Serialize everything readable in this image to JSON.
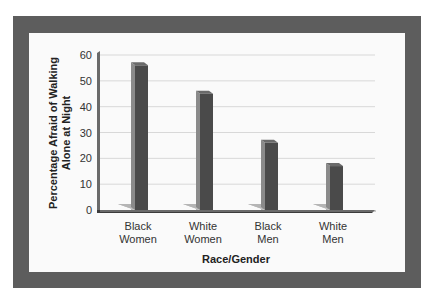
{
  "chart_data": {
    "type": "bar",
    "title": "",
    "xlabel": "Race/Gender",
    "ylabel": "Percentage Afraid of Walking Alone at Night",
    "ylabel_lines": [
      "Percentage Afraid of Walking",
      "Alone at Night"
    ],
    "categories": [
      "Black Women",
      "White Women",
      "Black Men",
      "White Men"
    ],
    "category_lines": [
      [
        "Black",
        "Women"
      ],
      [
        "White",
        "Women"
      ],
      [
        "Black",
        "Men"
      ],
      [
        "White",
        "Men"
      ]
    ],
    "values": [
      56,
      45,
      26,
      17
    ],
    "ylim": [
      0,
      60
    ],
    "yticks": [
      0,
      10,
      20,
      30,
      40,
      50,
      60
    ],
    "grid": true,
    "legend": "none",
    "style": "3d-column",
    "colors": {
      "bar_front": "#4a4a4a",
      "bar_side": "#8a8a8a",
      "bar_top": "#6a6a6a",
      "shadow": "#b5b5b5",
      "frame": "#5d5d5d",
      "panel": "#fafafa",
      "grid": "#d8d8d8",
      "axis": "#3c3c3c"
    }
  }
}
